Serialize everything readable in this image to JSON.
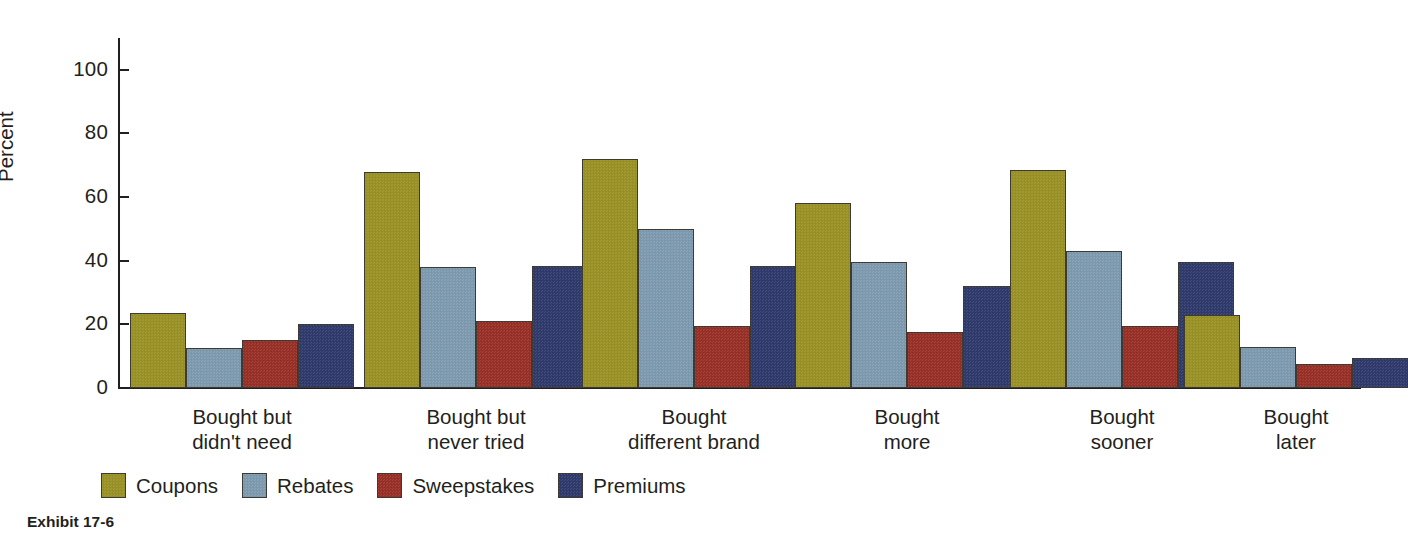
{
  "caption": "Exhibit 17-6",
  "chart_data": {
    "type": "bar",
    "title": "",
    "subtitle": "",
    "xlabel": "",
    "ylabel": "Percent",
    "ylim": [
      0,
      110
    ],
    "yticks": [
      0,
      20,
      40,
      60,
      80,
      100
    ],
    "ytick_labels": [
      "0",
      "20",
      "40",
      "60",
      "80",
      "100"
    ],
    "grid": false,
    "legend_position": "bottom-left",
    "categories": [
      "Bought but\ndidn't need",
      "Bought but\nnever tried",
      "Bought\ndifferent brand",
      "Bought\nmore",
      "Bought\nsooner",
      "Bought\nlater"
    ],
    "category_lines": [
      [
        "Bought but",
        "didn't need"
      ],
      [
        "Bought but",
        "never tried"
      ],
      [
        "Bought",
        "different brand"
      ],
      [
        "Bought",
        "more"
      ],
      [
        "Bought",
        "sooner"
      ],
      [
        "Bought",
        "later"
      ]
    ],
    "series": [
      {
        "name": "Coupons",
        "color": "#9b9326",
        "values": [
          23.5,
          68,
          72,
          58,
          68.5,
          23
        ]
      },
      {
        "name": "Rebates",
        "color": "#7e9bb0",
        "values": [
          12.5,
          38,
          50,
          39.5,
          43,
          13
        ]
      },
      {
        "name": "Sweepstakes",
        "color": "#993128",
        "values": [
          15,
          21,
          19.5,
          17.5,
          19.5,
          7.5
        ]
      },
      {
        "name": "Premiums",
        "color": "#303c6e",
        "values": [
          20,
          38.5,
          38.5,
          32,
          39.5,
          9.5
        ]
      }
    ]
  }
}
